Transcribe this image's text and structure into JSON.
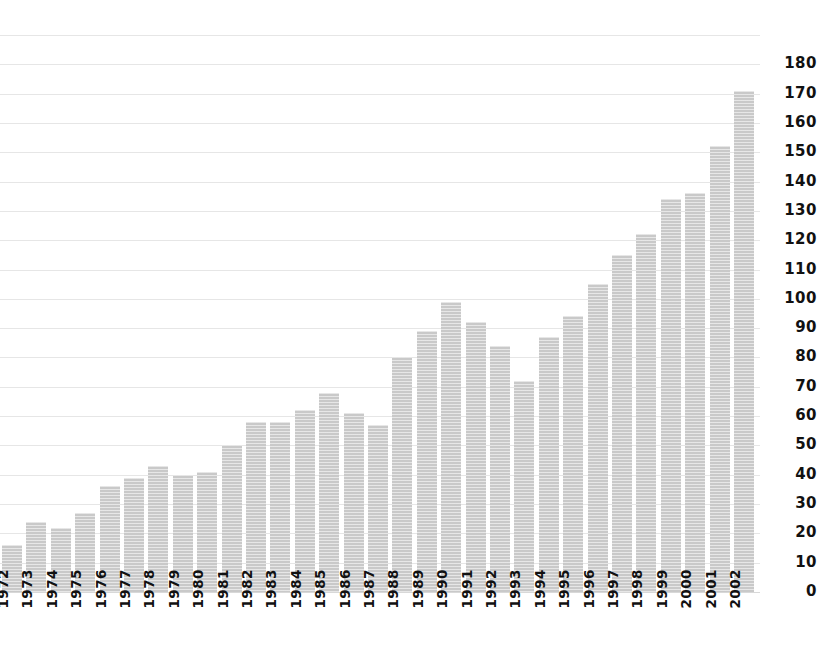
{
  "chart_data": {
    "type": "bar",
    "title": "",
    "subtitle": "",
    "xlabel": "",
    "ylabel": "",
    "categories": [
      "1972",
      "1973",
      "1974",
      "1975",
      "1976",
      "1977",
      "1978",
      "1979",
      "1980",
      "1981",
      "1982",
      "1983",
      "1984",
      "1985",
      "1986",
      "1987",
      "1988",
      "1989",
      "1990",
      "1991",
      "1992",
      "1993",
      "1994",
      "1995",
      "1996",
      "1997",
      "1998",
      "1999",
      "2000",
      "2001",
      "2002"
    ],
    "values": [
      16,
      24,
      22,
      27,
      36,
      39,
      43,
      40,
      41,
      50,
      58,
      58,
      62,
      68,
      61,
      57,
      80,
      89,
      99,
      92,
      84,
      72,
      87,
      94,
      105,
      115,
      122,
      134,
      136,
      152,
      171
    ],
    "series": [
      {
        "name": "value",
        "values": [
          16,
          24,
          22,
          27,
          36,
          39,
          43,
          40,
          41,
          50,
          58,
          58,
          62,
          68,
          61,
          57,
          80,
          89,
          99,
          92,
          84,
          72,
          87,
          94,
          105,
          115,
          122,
          134,
          136,
          152,
          171
        ]
      }
    ],
    "ylim": [
      0,
      190
    ],
    "yticks": [
      0,
      10,
      20,
      30,
      40,
      50,
      60,
      70,
      80,
      90,
      100,
      110,
      120,
      130,
      140,
      150,
      160,
      170,
      180
    ],
    "ytick_labels": [
      "0",
      "10",
      "20",
      "30",
      "40",
      "50",
      "60",
      "70",
      "80",
      "90",
      "100",
      "110",
      "120",
      "130",
      "140",
      "150",
      "160",
      "170",
      "180"
    ],
    "grid": true,
    "grid_orientation": "horizontal",
    "legend": false,
    "legend_position": "none",
    "annotations": [],
    "bar_color": "#c9c9c9",
    "grid_color": "#e6e6e6",
    "axis_text_color": "#111111",
    "background_color": "#ffffff",
    "x_label_rotation": 90,
    "bar_count": 31
  }
}
